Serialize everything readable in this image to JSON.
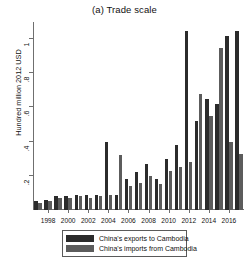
{
  "chart_data": {
    "type": "bar",
    "title": "(a) Trade scale",
    "xlabel": "",
    "ylabel": "Hundred million 2012 USD",
    "ylim": [
      0,
      1.1
    ],
    "yticks": [
      0.2,
      0.4,
      0.6,
      0.8,
      1
    ],
    "ytick_labels": [
      ".2",
      ".4",
      ".6",
      ".8",
      "1"
    ],
    "grid": false,
    "legend_position": "bottom-center",
    "x": [
      1997,
      1998,
      1999,
      2000,
      2001,
      2002,
      2003,
      2004,
      2005,
      2006,
      2007,
      2008,
      2009,
      2010,
      2011,
      2012,
      2013,
      2014,
      2015,
      2016,
      2017
    ],
    "xtick_labels": [
      "1998",
      "2000",
      "2002",
      "2004",
      "2006",
      "2008",
      "2010",
      "2012",
      "2014",
      "2016"
    ],
    "xticks": [
      1998,
      2000,
      2002,
      2004,
      2006,
      2008,
      2010,
      2012,
      2014,
      2016
    ],
    "series": [
      {
        "name": "China's exports to Cambodia",
        "color": "#2b2b2b",
        "values": [
          0.05,
          0.06,
          0.08,
          0.08,
          0.09,
          0.09,
          0.09,
          0.4,
          0.09,
          0.18,
          0.22,
          0.27,
          0.18,
          0.3,
          0.38,
          1.05,
          0.52,
          0.65,
          0.62,
          1.02,
          1.05
        ]
      },
      {
        "name": "China's imports from Cambodia",
        "color": "#5c5c5c",
        "values": [
          0.04,
          0.05,
          0.07,
          0.07,
          0.08,
          0.07,
          0.08,
          0.09,
          0.32,
          0.14,
          0.16,
          0.2,
          0.15,
          0.23,
          0.25,
          0.28,
          0.68,
          0.55,
          0.95,
          0.4,
          0.33
        ]
      }
    ]
  },
  "legend": {
    "items": [
      {
        "label": "China's exports to Cambodia",
        "key": "exports"
      },
      {
        "label": "China's imports from Cambodia",
        "key": "imports"
      }
    ]
  }
}
